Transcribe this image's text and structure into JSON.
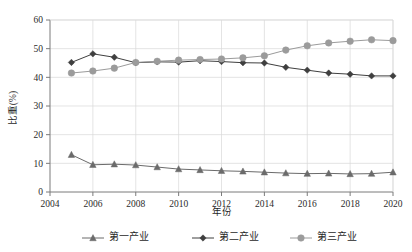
{
  "chart_data": {
    "type": "line",
    "title": "",
    "xlabel": "年份",
    "ylabel": "比重(%)",
    "xlim": [
      2004,
      2020
    ],
    "ylim": [
      0,
      60
    ],
    "grid": true,
    "legend_position": "bottom",
    "x_ticks": [
      "2004",
      "2006",
      "2008",
      "2010",
      "2012",
      "2014",
      "2016",
      "2018",
      "2020"
    ],
    "y_ticks": [
      "0",
      "10",
      "20",
      "30",
      "40",
      "50",
      "60"
    ],
    "x": [
      2005,
      2006,
      2007,
      2008,
      2009,
      2010,
      2011,
      2012,
      2013,
      2014,
      2015,
      2016,
      2017,
      2018,
      2019,
      2020
    ],
    "series": [
      {
        "name": "第一产业",
        "marker": "triangle",
        "color": "#6b6b6b",
        "values": [
          13.0,
          9.5,
          9.7,
          9.4,
          8.7,
          8.0,
          7.7,
          7.4,
          7.2,
          6.9,
          6.6,
          6.4,
          6.5,
          6.3,
          6.4,
          6.9
        ]
      },
      {
        "name": "第二产业",
        "marker": "diamond",
        "color": "#3f3f3f",
        "values": [
          45.2,
          48.2,
          47.0,
          45.1,
          45.4,
          45.3,
          45.8,
          45.5,
          45.1,
          45.0,
          43.5,
          42.5,
          41.5,
          41.1,
          40.5,
          40.5
        ]
      },
      {
        "name": "第三产业",
        "marker": "circle",
        "color": "#9b9b9b",
        "values": [
          41.5,
          42.2,
          43.2,
          45.2,
          45.6,
          46.0,
          46.2,
          46.4,
          46.8,
          47.5,
          49.5,
          51.0,
          52.0,
          52.6,
          53.1,
          52.8
        ]
      }
    ]
  },
  "legend": {
    "items": [
      {
        "label": "第一产业"
      },
      {
        "label": "第二产业"
      },
      {
        "label": "第三产业"
      }
    ]
  }
}
